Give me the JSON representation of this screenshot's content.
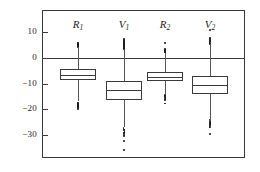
{
  "chart_data": {
    "type": "box",
    "title": "",
    "xlabel": "",
    "ylabel": "",
    "ylim": [
      -38,
      14
    ],
    "yticks": [
      10,
      0,
      -10,
      -20,
      -30
    ],
    "ytick_labels": [
      "10",
      "0",
      "−10",
      "−20",
      "−30"
    ],
    "grid": false,
    "legend": "none",
    "zero_line": 0,
    "categories": [
      "R₁",
      "V₁",
      "R₂",
      "V₂"
    ],
    "series": [
      {
        "name": "R1",
        "label_base": "R",
        "label_sub": "1",
        "q1": -8.5,
        "median": -6.5,
        "q3": -4.5,
        "whisker_low": -17.0,
        "whisker_high": 4.0,
        "outliers_low": [
          -17.4,
          -17.8,
          -18.1,
          -18.4,
          -18.7,
          -19.0,
          -19.3,
          -19.6,
          -19.9,
          -18.0,
          -18.6,
          -19.2
        ],
        "outliers_high": [
          4.3,
          4.6,
          4.9,
          5.2,
          5.5,
          5.8,
          6.0,
          4.5,
          5.0,
          5.6
        ]
      },
      {
        "name": "V1",
        "label_base": "V",
        "label_sub": "1",
        "q1": -16.5,
        "median": -12.5,
        "q3": -9.0,
        "whisker_low": -27.0,
        "whisker_high": 3.0,
        "outliers_low": [
          -27.5,
          -28.0,
          -28.5,
          -29.0,
          -29.5,
          -30.0,
          -30.5,
          -28.2,
          -29.2,
          -32.5,
          -36.0
        ],
        "outliers_high": [
          3.4,
          3.8,
          4.2,
          4.6,
          5.0,
          5.4,
          5.8,
          6.2,
          6.6,
          7.0,
          7.4,
          4.0,
          5.2,
          6.0
        ]
      },
      {
        "name": "R2",
        "label_base": "R",
        "label_sub": "2",
        "q1": -9.0,
        "median": -7.5,
        "q3": -5.5,
        "whisker_low": -14.0,
        "whisker_high": 2.0,
        "outliers_low": [
          -14.4,
          -14.8,
          -15.2,
          -15.6,
          -16.0,
          -16.4,
          -15.0,
          -15.8,
          -17.8
        ],
        "outliers_high": [
          2.3,
          2.6,
          2.9,
          3.2,
          3.5,
          2.5,
          3.0,
          6.0
        ]
      },
      {
        "name": "V2",
        "label_base": "V",
        "label_sub": "2",
        "q1": -14.0,
        "median": -10.5,
        "q3": -7.0,
        "whisker_low": -24.0,
        "whisker_high": 5.0,
        "outliers_low": [
          -24.4,
          -24.9,
          -25.4,
          -25.9,
          -26.4,
          -26.9,
          -25.0,
          -26.0,
          -27.0,
          -29.8
        ],
        "outliers_high": [
          5.4,
          5.8,
          6.2,
          6.6,
          7.0,
          7.4,
          7.8,
          6.0,
          6.8,
          11.0
        ]
      }
    ]
  },
  "figure": {
    "background_color": "#ffffff",
    "line_color": "#3a3a3a",
    "marker_color": "#1a1a1a"
  }
}
